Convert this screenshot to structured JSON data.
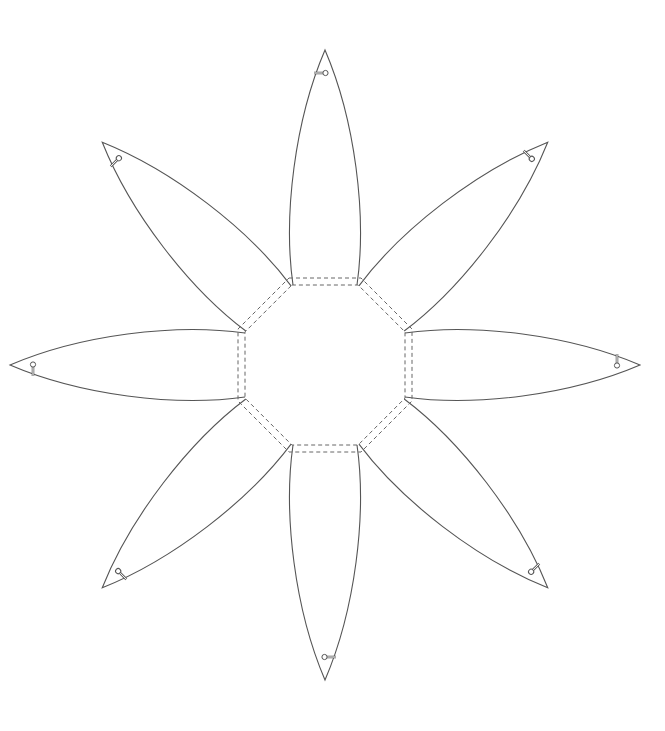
{
  "diagram": {
    "title": "",
    "canvas": {
      "width": 665,
      "height": 731,
      "background": "#ffffff"
    },
    "center": {
      "x": 325,
      "y": 365
    },
    "colors": {
      "outline": "#555555",
      "fold_line": "#666666",
      "pin": "#666666"
    },
    "octagon": {
      "inner_apothem": 80,
      "outer_apothem": 87,
      "fold_style": "dashed",
      "fold_line_count": 2
    },
    "petals": [
      {
        "name": "petal-top",
        "angle": 0
      },
      {
        "name": "petal-top-right",
        "angle": 45
      },
      {
        "name": "petal-right",
        "angle": 90
      },
      {
        "name": "petal-bottom-right",
        "angle": 135
      },
      {
        "name": "petal-bottom",
        "angle": 180
      },
      {
        "name": "petal-bottom-left",
        "angle": 225
      },
      {
        "name": "petal-left",
        "angle": 270
      },
      {
        "name": "petal-top-left",
        "angle": 315
      }
    ],
    "petal_shape": {
      "base_half_width": 32,
      "tip_distance": 315,
      "pin_marker": "slot-with-circle"
    }
  }
}
